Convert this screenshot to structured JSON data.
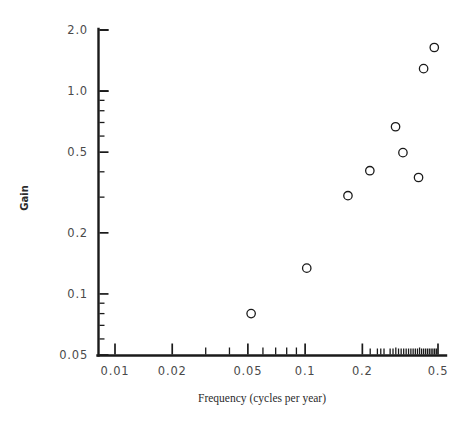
{
  "chart_data": {
    "type": "scatter",
    "title": "",
    "xlabel": "Frequency (cycles per year)",
    "ylabel": "Gain",
    "xscale": "log",
    "yscale": "log",
    "xlim": [
      0.008,
      0.52
    ],
    "ylim": [
      0.05,
      2.0
    ],
    "grid": false,
    "legend": null,
    "marker": "open-circle",
    "x_tick_labels": [
      "0.01",
      "0.02",
      "0.05",
      "0.1",
      "0.2",
      "0.5"
    ],
    "x_tick_values": [
      0.01,
      0.02,
      0.05,
      0.1,
      0.2,
      0.5
    ],
    "y_tick_labels": [
      "0.05",
      "0.1",
      "0.2",
      "0.5",
      "1.0",
      "2.0"
    ],
    "y_tick_values": [
      0.05,
      0.1,
      0.2,
      0.5,
      1.0,
      2.0
    ],
    "x": [
      0.052,
      0.102,
      0.168,
      0.219,
      0.299,
      0.327,
      0.395,
      0.455
    ],
    "y": [
      0.08,
      0.134,
      0.305,
      0.405,
      0.667,
      0.497,
      0.375,
      1.29
    ],
    "points": [
      {
        "x": 0.052,
        "y": 0.08
      },
      {
        "x": 0.102,
        "y": 0.134
      },
      {
        "x": 0.168,
        "y": 0.305
      },
      {
        "x": 0.219,
        "y": 0.405
      },
      {
        "x": 0.299,
        "y": 0.667
      },
      {
        "x": 0.327,
        "y": 0.497
      },
      {
        "x": 0.395,
        "y": 0.375
      },
      {
        "x": 0.42,
        "y": 1.29
      },
      {
        "x": 0.478,
        "y": 1.64
      }
    ],
    "n_points": 9,
    "series_name": "gain"
  },
  "figure": {
    "background_color": "#ffffff",
    "ink_color": "#1a1a1a",
    "tick_label_color": "#4a4a4a"
  }
}
